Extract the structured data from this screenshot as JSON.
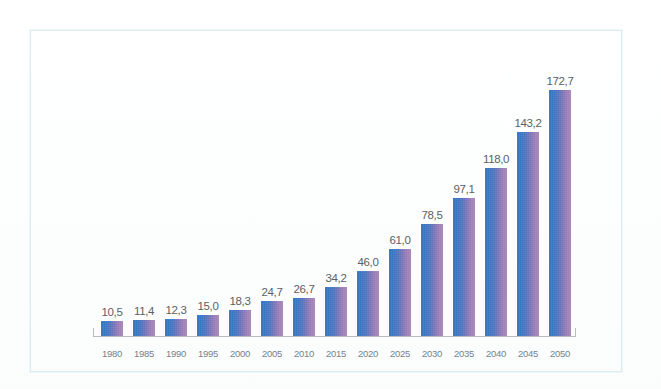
{
  "chart_data": {
    "type": "bar",
    "title": "",
    "subtitle": "",
    "xlabel": "",
    "ylabel": "",
    "categories": [
      "1980",
      "1985",
      "1990",
      "1995",
      "2000",
      "2005",
      "2010",
      "2015",
      "2020",
      "2025",
      "2030",
      "2035",
      "2040",
      "2045",
      "2050"
    ],
    "values": [
      10.5,
      11.4,
      12.3,
      15.0,
      18.3,
      24.7,
      26.7,
      34.2,
      46.0,
      61.0,
      78.5,
      97.1,
      118.0,
      143.2,
      172.7
    ],
    "value_labels": [
      "10,5",
      "11,4",
      "12,3",
      "15,0",
      "18,3",
      "24,7",
      "26,7",
      "34,2",
      "46,0",
      "61,0",
      "78,5",
      "97,1",
      "118,0",
      "143,2",
      "172,7"
    ],
    "ylim": [
      0,
      185
    ],
    "grid": false,
    "legend": null,
    "legend_position": "none",
    "decimal_separator": ",",
    "bars": [
      {
        "category": "1980",
        "value": 10.5,
        "label": "10,5"
      },
      {
        "category": "1985",
        "value": 11.4,
        "label": "11,4"
      },
      {
        "category": "1990",
        "value": 12.3,
        "label": "12,3"
      },
      {
        "category": "1995",
        "value": 15.0,
        "label": "15,0"
      },
      {
        "category": "2000",
        "value": 18.3,
        "label": "18,3"
      },
      {
        "category": "2005",
        "value": 24.7,
        "label": "24,7"
      },
      {
        "category": "2010",
        "value": 26.7,
        "label": "26,7"
      },
      {
        "category": "2015",
        "value": 34.2,
        "label": "34,2"
      },
      {
        "category": "2020",
        "value": 46.0,
        "label": "46,0"
      },
      {
        "category": "2025",
        "value": 61.0,
        "label": "61,0"
      },
      {
        "category": "2030",
        "value": 78.5,
        "label": "78,5"
      },
      {
        "category": "2035",
        "value": 97.1,
        "label": "97,1"
      },
      {
        "category": "2040",
        "value": 118.0,
        "label": "118,0"
      },
      {
        "category": "2045",
        "value": 143.2,
        "label": "143,2"
      },
      {
        "category": "2050",
        "value": 172.7,
        "label": "172,7"
      }
    ]
  },
  "style": {
    "bar_gradient_start": "#2f6fc2",
    "bar_gradient_end": "#a884b8",
    "value_label_color": "#5b5f63",
    "category_label_color": "#7b7f84",
    "axis_color": "#b9bcc0",
    "frame_border_color": "#daeef2",
    "background": "#ffffff"
  }
}
